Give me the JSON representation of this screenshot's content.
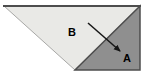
{
  "diagram": {
    "labels": {
      "triangle_b": "B",
      "triangle_a": "A"
    },
    "colors": {
      "background": "#ffffff",
      "triangle_b_fill": "#e9e9e6",
      "triangle_b_edge": "#a8a8a6",
      "triangle_a_fill": "#8f8f8f",
      "triangle_a_edge": "#4d4d4d",
      "top_edge": "#4d4d4d",
      "arrow": "#161616",
      "label_text": "#000000"
    }
  }
}
